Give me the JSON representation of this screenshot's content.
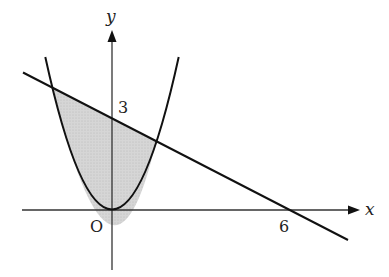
{
  "figure": {
    "top_text_fragment": "",
    "axes": {
      "x_label": "x",
      "y_label": "y",
      "origin_label": "O"
    },
    "tick_labels": {
      "y_intercept": "3",
      "x_intercept": "6"
    },
    "curves": [
      {
        "name": "parabola",
        "equation": "y = x^2"
      },
      {
        "name": "line",
        "equation": "y = -x/2 + 3"
      }
    ],
    "intersections": [
      [
        -2,
        4
      ],
      [
        1.5,
        2.25
      ]
    ],
    "shaded_region": "between line (above) and parabola (below), x from -2 to 1.5",
    "colors": {
      "stroke": "#1a1a1a",
      "shade": "#cfcfcf",
      "background": "#ffffff"
    }
  }
}
